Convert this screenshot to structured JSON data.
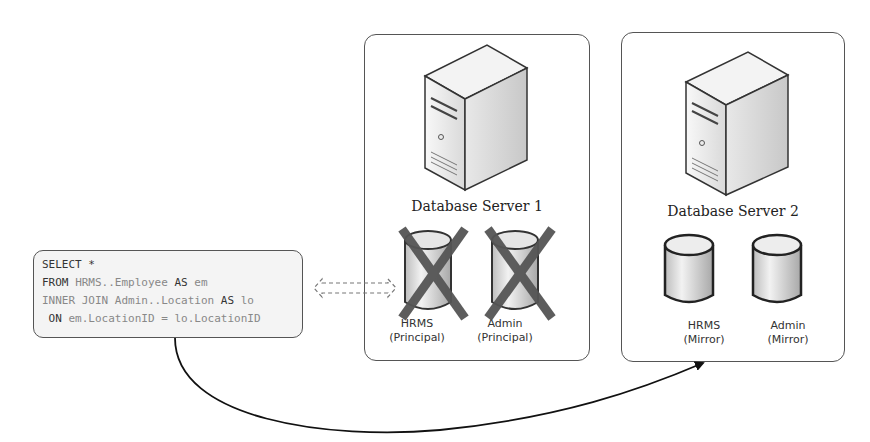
{
  "query": {
    "lines": [
      [
        {
          "t": "SELECT *",
          "kw": true
        }
      ],
      [
        {
          "t": "FROM ",
          "kw": true
        },
        {
          "t": "HRMS..Employee ",
          "kw": false
        },
        {
          "t": "AS",
          "kw": true
        },
        {
          "t": " em",
          "kw": false
        }
      ],
      [
        {
          "t": "INNER JOIN Admin..Location ",
          "kw": false
        },
        {
          "t": "AS",
          "kw": true
        },
        {
          "t": " lo",
          "kw": false
        }
      ],
      [
        {
          "t": " ON",
          "kw": true
        },
        {
          "t": " em.LocationID = lo.LocationID",
          "kw": false
        }
      ]
    ]
  },
  "servers": [
    {
      "title": "Database Server 1",
      "databases": [
        {
          "name": "HRMS",
          "role": "(Principal)",
          "status": "unavailable"
        },
        {
          "name": "Admin",
          "role": "(Principal)",
          "status": "unavailable"
        }
      ]
    },
    {
      "title": "Database Server 2",
      "databases": [
        {
          "name": "HRMS",
          "role": "(Mirror)",
          "status": "available"
        },
        {
          "name": "Admin",
          "role": "(Mirror)",
          "status": "available"
        }
      ]
    }
  ],
  "connections": [
    {
      "from": "query",
      "to": "Database Server 1",
      "style": "dashed-double-arrow"
    },
    {
      "from": "query",
      "to": "Database Server 2",
      "style": "solid-curved-arrow"
    }
  ],
  "colors": {
    "border": "#555555",
    "cross": "#555555",
    "arrow": "#111111"
  }
}
